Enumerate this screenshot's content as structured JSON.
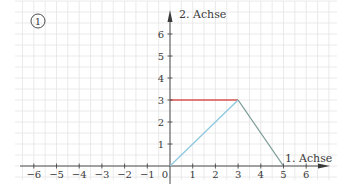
{
  "figure": {
    "label": "1",
    "x_axis_label": "1. Achse",
    "y_axis_label": "2. Achse"
  },
  "chart_data": {
    "type": "line",
    "title": "",
    "figure_number": "1",
    "xlabel": "1. Achse",
    "ylabel": "2. Achse",
    "xlim": [
      -6.5,
      7
    ],
    "ylim": [
      -0.6,
      7.4
    ],
    "x_ticks": [
      -6,
      -5,
      -4,
      -3,
      -2,
      -1,
      0,
      1,
      2,
      3,
      4,
      5,
      6
    ],
    "y_ticks": [
      1,
      2,
      3,
      4,
      5,
      6
    ],
    "grid": true,
    "grid_step": 0.5,
    "series": [
      {
        "name": "red-segment",
        "color": "#d9534f",
        "points": [
          [
            0,
            3
          ],
          [
            3,
            3
          ]
        ]
      },
      {
        "name": "blue-segment",
        "color": "#8ec8df",
        "points": [
          [
            0,
            0
          ],
          [
            3,
            3
          ]
        ]
      },
      {
        "name": "gray-segment",
        "color": "#7d9c98",
        "points": [
          [
            3,
            3
          ],
          [
            5,
            0
          ]
        ]
      }
    ]
  },
  "colors": {
    "grid": "#e4e4e4",
    "axis": "#3a3a3a"
  }
}
